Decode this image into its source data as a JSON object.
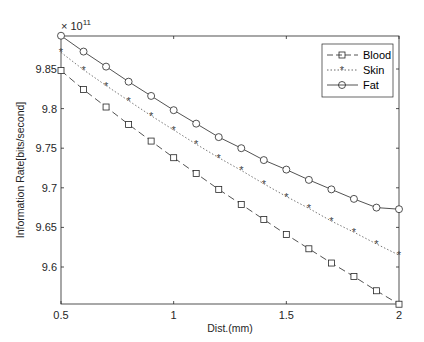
{
  "chart_data": {
    "type": "line",
    "title": "",
    "xlabel": "Dist.(mm)",
    "ylabel": "Information Rate[bits/second]",
    "y_exponent_label": "× 10",
    "y_exponent_power": "11",
    "xlim": [
      0.5,
      2
    ],
    "ylim": [
      9.55,
      9.89
    ],
    "xticks": [
      "0.5",
      "1",
      "1.5",
      "2"
    ],
    "yticks": [
      "9.6",
      "9.65",
      "9.7",
      "9.75",
      "9.8",
      "9.85"
    ],
    "grid": false,
    "legend_position": "upper right",
    "x": [
      0.5,
      0.6,
      0.7,
      0.8,
      0.9,
      1.0,
      1.1,
      1.2,
      1.3,
      1.4,
      1.5,
      1.6,
      1.7,
      1.8,
      1.9,
      2.0
    ],
    "series": [
      {
        "name": "Blood",
        "style": "dashed",
        "marker": "square",
        "values": [
          9.848,
          9.824,
          9.802,
          9.78,
          9.759,
          9.738,
          9.718,
          9.698,
          9.679,
          9.66,
          9.641,
          9.623,
          9.605,
          9.588,
          9.57,
          9.553
        ]
      },
      {
        "name": "Skin",
        "style": "dotted",
        "marker": "asterisk",
        "values": [
          9.871,
          9.849,
          9.829,
          9.81,
          9.791,
          9.773,
          9.755,
          9.738,
          9.722,
          9.705,
          9.689,
          9.674,
          9.658,
          9.644,
          9.629,
          9.615
        ]
      },
      {
        "name": "Fat",
        "style": "solid",
        "marker": "circle",
        "values": [
          9.892,
          9.872,
          9.853,
          9.834,
          9.816,
          9.798,
          9.781,
          9.764,
          9.75,
          9.735,
          9.723,
          9.71,
          9.698,
          9.686,
          9.675,
          9.673
        ]
      }
    ]
  },
  "legend": {
    "items": [
      {
        "label": "Blood"
      },
      {
        "label": "Skin"
      },
      {
        "label": "Fat"
      }
    ]
  }
}
